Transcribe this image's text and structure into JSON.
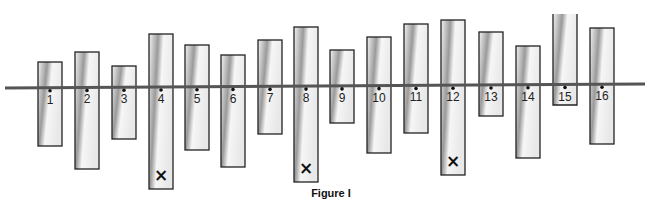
{
  "figure": {
    "caption": "Figure I",
    "reference_line": "horizontal-line",
    "bars": [
      {
        "label": "1",
        "marked": false
      },
      {
        "label": "2",
        "marked": false
      },
      {
        "label": "3",
        "marked": false
      },
      {
        "label": "4",
        "marked": true
      },
      {
        "label": "5",
        "marked": false
      },
      {
        "label": "6",
        "marked": false
      },
      {
        "label": "7",
        "marked": false
      },
      {
        "label": "8",
        "marked": true
      },
      {
        "label": "9",
        "marked": false
      },
      {
        "label": "10",
        "marked": false
      },
      {
        "label": "11",
        "marked": false
      },
      {
        "label": "12",
        "marked": true
      },
      {
        "label": "13",
        "marked": false
      },
      {
        "label": "14",
        "marked": false
      },
      {
        "label": "15",
        "marked": false
      },
      {
        "label": "16",
        "marked": false
      }
    ],
    "mark_symbol": "×",
    "colors": {
      "outline": "#222222",
      "line": "#555555",
      "shade_dark": "#8a8a8a",
      "shade_light": "#f4f4f4"
    }
  }
}
